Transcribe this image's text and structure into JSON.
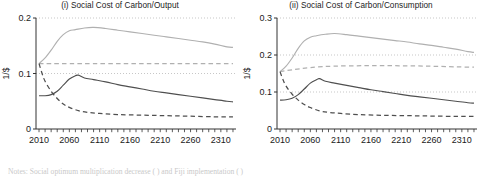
{
  "figure": {
    "notes_label": "Notes:",
    "notes_text": "Social optimum multiplication decrease (      ) and Fiji implementation (      )"
  },
  "chart_data": [
    {
      "type": "line",
      "panel_id": "i",
      "title": "(i) Social Cost of Carbon/Output",
      "xlabel": "",
      "ylabel": "1/$",
      "xlim": [
        2005,
        2335
      ],
      "ylim": [
        0,
        0.2
      ],
      "xticks": [
        2010,
        2060,
        2110,
        2160,
        2210,
        2260,
        2310
      ],
      "xtick_labels": [
        "2010",
        "2060",
        "2110",
        "2160",
        "2210",
        "2260",
        "2310"
      ],
      "x_minor_tick_step": 10,
      "yticks": [
        0,
        0.1,
        0.2
      ],
      "ytick_labels": [
        "0",
        "0.1",
        "0.2"
      ],
      "grid": "horizontal-dotted",
      "gridlines": [
        0.1,
        0.2
      ],
      "legend_position": "none",
      "series": [
        {
          "name": "light-solid",
          "color": "#b0b0b0",
          "dash": "solid",
          "x": [
            2010,
            2020,
            2030,
            2040,
            2050,
            2060,
            2070,
            2085,
            2100,
            2120,
            2140,
            2160,
            2180,
            2200,
            2220,
            2240,
            2260,
            2280,
            2300,
            2320,
            2330
          ],
          "values": [
            0.118,
            0.128,
            0.142,
            0.158,
            0.17,
            0.177,
            0.179,
            0.182,
            0.183,
            0.181,
            0.178,
            0.175,
            0.172,
            0.169,
            0.166,
            0.163,
            0.16,
            0.157,
            0.153,
            0.148,
            0.147
          ]
        },
        {
          "name": "light-dashed",
          "color": "#b0b0b0",
          "dash": "dashed",
          "x": [
            2010,
            2030,
            2060,
            2100,
            2150,
            2200,
            2250,
            2300,
            2330
          ],
          "values": [
            0.118,
            0.118,
            0.118,
            0.118,
            0.118,
            0.118,
            0.118,
            0.118,
            0.118
          ]
        },
        {
          "name": "dark-solid",
          "color": "#4f4f4f",
          "dash": "solid",
          "x": [
            2010,
            2020,
            2030,
            2040,
            2050,
            2060,
            2070,
            2075,
            2085,
            2100,
            2120,
            2140,
            2160,
            2180,
            2200,
            2220,
            2240,
            2260,
            2280,
            2300,
            2320,
            2330
          ],
          "values": [
            0.06,
            0.06,
            0.062,
            0.068,
            0.079,
            0.09,
            0.096,
            0.097,
            0.092,
            0.089,
            0.085,
            0.08,
            0.076,
            0.072,
            0.068,
            0.065,
            0.062,
            0.059,
            0.056,
            0.053,
            0.05,
            0.049
          ]
        },
        {
          "name": "dark-dashed",
          "color": "#4f4f4f",
          "dash": "dashed",
          "x": [
            2010,
            2015,
            2020,
            2030,
            2040,
            2050,
            2060,
            2075,
            2090,
            2110,
            2140,
            2180,
            2220,
            2260,
            2300,
            2330
          ],
          "values": [
            0.118,
            0.1,
            0.086,
            0.068,
            0.055,
            0.045,
            0.039,
            0.033,
            0.03,
            0.028,
            0.026,
            0.025,
            0.024,
            0.023,
            0.022,
            0.022
          ]
        }
      ]
    },
    {
      "type": "line",
      "panel_id": "ii",
      "title": "(ii) Social Cost of Carbon/Consumption",
      "xlabel": "",
      "ylabel": "1/$",
      "xlim": [
        2005,
        2335
      ],
      "ylim": [
        0,
        0.3
      ],
      "xticks": [
        2010,
        2060,
        2110,
        2160,
        2210,
        2260,
        2310
      ],
      "xtick_labels": [
        "2010",
        "2060",
        "2110",
        "2160",
        "2210",
        "2260",
        "2310"
      ],
      "x_minor_tick_step": 10,
      "yticks": [
        0,
        0.1,
        0.2,
        0.3
      ],
      "ytick_labels": [
        "0",
        "0.1",
        "0.2",
        "0.3"
      ],
      "grid": "horizontal-dotted",
      "gridlines": [
        0.1,
        0.2,
        0.3
      ],
      "legend_position": "none",
      "series": [
        {
          "name": "light-solid",
          "color": "#b0b0b0",
          "dash": "solid",
          "x": [
            2010,
            2020,
            2030,
            2040,
            2050,
            2060,
            2070,
            2085,
            2100,
            2120,
            2140,
            2160,
            2180,
            2200,
            2220,
            2240,
            2260,
            2280,
            2300,
            2320,
            2330
          ],
          "values": [
            0.155,
            0.17,
            0.192,
            0.218,
            0.238,
            0.248,
            0.252,
            0.256,
            0.258,
            0.255,
            0.251,
            0.247,
            0.243,
            0.239,
            0.235,
            0.23,
            0.226,
            0.221,
            0.216,
            0.209,
            0.207
          ]
        },
        {
          "name": "light-dashed",
          "color": "#b0b0b0",
          "dash": "dashed",
          "x": [
            2010,
            2030,
            2060,
            2100,
            2150,
            2200,
            2250,
            2300,
            2330
          ],
          "values": [
            0.155,
            0.16,
            0.166,
            0.17,
            0.171,
            0.171,
            0.17,
            0.168,
            0.167
          ]
        },
        {
          "name": "dark-solid",
          "color": "#4f4f4f",
          "dash": "solid",
          "x": [
            2010,
            2020,
            2030,
            2040,
            2050,
            2060,
            2070,
            2075,
            2085,
            2100,
            2120,
            2140,
            2160,
            2180,
            2200,
            2220,
            2240,
            2260,
            2280,
            2300,
            2320,
            2330
          ],
          "values": [
            0.078,
            0.079,
            0.083,
            0.093,
            0.108,
            0.124,
            0.133,
            0.136,
            0.129,
            0.124,
            0.118,
            0.112,
            0.106,
            0.101,
            0.096,
            0.091,
            0.087,
            0.083,
            0.079,
            0.075,
            0.071,
            0.07
          ]
        },
        {
          "name": "dark-dashed",
          "color": "#4f4f4f",
          "dash": "dashed",
          "x": [
            2010,
            2015,
            2020,
            2030,
            2040,
            2050,
            2060,
            2075,
            2090,
            2110,
            2140,
            2180,
            2220,
            2260,
            2300,
            2330
          ],
          "values": [
            0.155,
            0.133,
            0.116,
            0.094,
            0.078,
            0.066,
            0.058,
            0.049,
            0.045,
            0.042,
            0.039,
            0.037,
            0.036,
            0.035,
            0.034,
            0.034
          ]
        }
      ]
    }
  ]
}
